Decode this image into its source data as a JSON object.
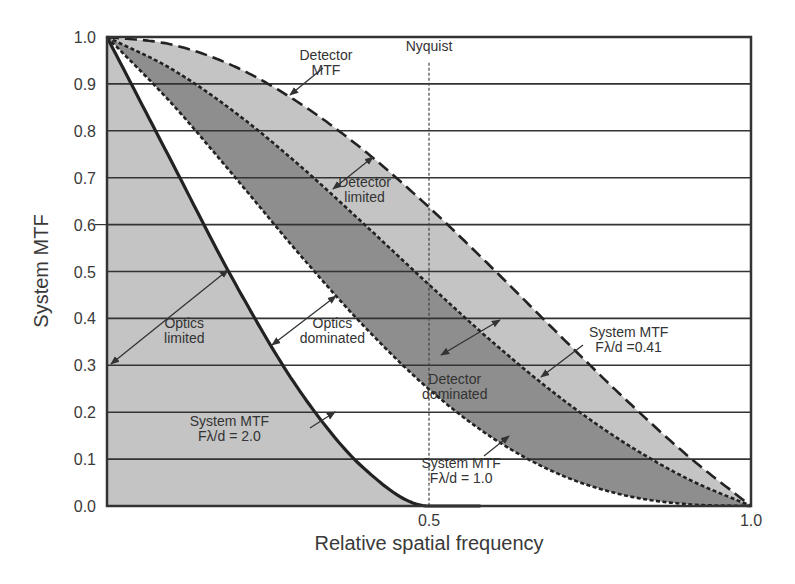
{
  "chart_data": {
    "type": "line",
    "title": "",
    "xlabel": "Relative spatial frequency",
    "ylabel": "System MTF",
    "xlim": [
      0,
      1.0
    ],
    "ylim": [
      0,
      1.0
    ],
    "grid": {
      "horizontal": true,
      "vertical": false
    },
    "x_ticks": [
      {
        "value": 0.5,
        "label": "0.5"
      },
      {
        "value": 1.0,
        "label": "1.0"
      }
    ],
    "y_ticks": [
      {
        "value": 0.0,
        "label": "0.0"
      },
      {
        "value": 0.1,
        "label": "0.1"
      },
      {
        "value": 0.2,
        "label": "0.2"
      },
      {
        "value": 0.3,
        "label": "0.3"
      },
      {
        "value": 0.4,
        "label": "0.4"
      },
      {
        "value": 0.5,
        "label": "0.5"
      },
      {
        "value": 0.6,
        "label": "0.6"
      },
      {
        "value": 0.7,
        "label": "0.7"
      },
      {
        "value": 0.8,
        "label": "0.8"
      },
      {
        "value": 0.9,
        "label": "0.9"
      },
      {
        "value": 1.0,
        "label": "1.0"
      }
    ],
    "x": [
      0,
      0.1,
      0.2,
      0.3,
      0.4,
      0.5,
      0.6,
      0.7,
      0.8,
      0.9,
      1.0
    ],
    "series": [
      {
        "name": "Detector MTF",
        "style": "long-dash",
        "values": [
          1.0,
          0.984,
          0.936,
          0.858,
          0.757,
          0.637,
          0.505,
          0.368,
          0.234,
          0.109,
          0.0
        ]
      },
      {
        "name": "System MTF Fλ/d =0.41",
        "style": "dotted",
        "values": [
          1.0,
          0.932,
          0.838,
          0.725,
          0.6,
          0.472,
          0.348,
          0.235,
          0.138,
          0.059,
          0.0
        ]
      },
      {
        "name": "System MTF Fλ/d = 1.0",
        "style": "dotted",
        "values": [
          1.0,
          0.859,
          0.699,
          0.535,
          0.382,
          0.249,
          0.144,
          0.069,
          0.024,
          0.004,
          0.0
        ]
      },
      {
        "name": "System MTF Fλ/d = 2.0",
        "style": "solid",
        "values": [
          1.0,
          0.735,
          0.472,
          0.244,
          0.079,
          0.0,
          0.0,
          0.0,
          0.0,
          0.0,
          0.0
        ]
      }
    ],
    "regions": [
      {
        "name": "Optics limited",
        "between": [
          "x-axis",
          "System MTF Fλ/d = 2.0"
        ],
        "fill": "#c4c4c4"
      },
      {
        "name": "Optics dominated",
        "between": [
          "System MTF Fλ/d = 2.0",
          "System MTF Fλ/d = 1.0"
        ],
        "fill": "#ffffff"
      },
      {
        "name": "Detector dominated",
        "between": [
          "System MTF Fλ/d = 1.0",
          "System MTF Fλ/d =0.41"
        ],
        "fill": "#8e8e8e"
      },
      {
        "name": "Detector limited",
        "between": [
          "System MTF Fλ/d =0.41",
          "Detector MTF"
        ],
        "fill": "#c4c4c4"
      }
    ],
    "vertical_marker": {
      "x": 0.5,
      "label": "Nyquist",
      "style": "dotted"
    },
    "annotations": [
      {
        "text": [
          "Detector",
          "MTF"
        ],
        "x": 0.34,
        "y": 0.95
      },
      {
        "text": [
          "Nyquist"
        ],
        "x": 0.5,
        "y": 0.97
      },
      {
        "text": [
          "Detector",
          "limited"
        ],
        "x": 0.4,
        "y": 0.68
      },
      {
        "text": [
          "Optics",
          "limited"
        ],
        "x": 0.12,
        "y": 0.38
      },
      {
        "text": [
          "Optics",
          "dominated"
        ],
        "x": 0.35,
        "y": 0.38
      },
      {
        "text": [
          "System MTF",
          "Fλ/d =0.41"
        ],
        "x": 0.81,
        "y": 0.36
      },
      {
        "text": [
          "Detector",
          "dominated"
        ],
        "x": 0.54,
        "y": 0.26
      },
      {
        "text": [
          "System MTF",
          "Fλ/d = 2.0"
        ],
        "x": 0.19,
        "y": 0.17
      },
      {
        "text": [
          "System MTF",
          "Fλ/d = 1.0"
        ],
        "x": 0.55,
        "y": 0.08
      }
    ]
  },
  "colors": {
    "light_fill": "#c4c4c4",
    "dark_fill": "#8e8e8e",
    "line": "#222222",
    "grid": "#333333",
    "text": "#3a3a3a"
  }
}
